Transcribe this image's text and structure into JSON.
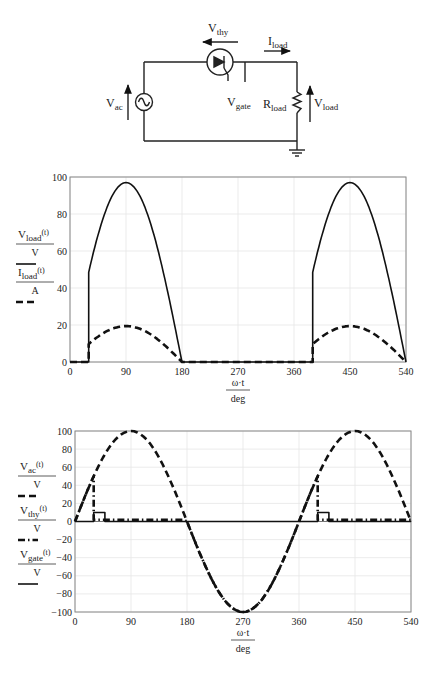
{
  "circuit": {
    "source_label": "V",
    "source_sub": "ac",
    "thyristor_label": "V",
    "thyristor_sub": "thy",
    "gate_label": "V",
    "gate_sub": "gate",
    "current_label": "I",
    "current_sub": "load",
    "resistor_label": "R",
    "resistor_sub": "load",
    "load_voltage_label": "V",
    "load_voltage_sub": "load"
  },
  "chart_data": [
    {
      "type": "line",
      "title": "",
      "xlabel": "ω·t / deg",
      "xlabel_num": "ω·t",
      "xlabel_den": "deg",
      "ylabel": "",
      "xlim": [
        0,
        540
      ],
      "ylim": [
        0,
        100
      ],
      "xticks": [
        0,
        90,
        180,
        270,
        360,
        450,
        540
      ],
      "yticks": [
        0,
        20,
        40,
        60,
        80,
        100
      ],
      "grid": true,
      "legend": [
        {
          "num": "V",
          "sub": "load",
          "arg": "(t)",
          "den": "V",
          "style": "solid"
        },
        {
          "num": "I",
          "sub": "load",
          "arg": "(t)",
          "den": "A",
          "style": "dashed"
        }
      ],
      "series": [
        {
          "name": "Vload(t)/V",
          "style": "solid",
          "x": [
            0,
            30,
            30,
            45,
            60,
            75,
            90,
            105,
            120,
            135,
            150,
            165,
            180,
            360,
            390,
            390,
            405,
            420,
            435,
            450,
            465,
            480,
            495,
            510,
            525,
            540
          ],
          "values": [
            0,
            0,
            48.5,
            68.6,
            84,
            93.7,
            97,
            93.7,
            84,
            68.6,
            48.5,
            25.1,
            0,
            0,
            0,
            48.5,
            68.6,
            84,
            93.7,
            97,
            93.7,
            84,
            68.6,
            48.5,
            25.1,
            0
          ]
        },
        {
          "name": "Iload(t)/A",
          "style": "dashed",
          "x": [
            0,
            30,
            30,
            45,
            60,
            75,
            90,
            105,
            120,
            135,
            150,
            165,
            180,
            360,
            390,
            390,
            405,
            420,
            435,
            450,
            465,
            480,
            495,
            510,
            525,
            540
          ],
          "values": [
            0,
            0,
            9.7,
            13.7,
            16.8,
            18.7,
            19.4,
            18.7,
            16.8,
            13.7,
            9.7,
            5.0,
            0,
            0,
            0,
            9.7,
            13.7,
            16.8,
            18.7,
            19.4,
            18.7,
            16.8,
            13.7,
            9.7,
            5.0,
            0
          ]
        }
      ]
    },
    {
      "type": "line",
      "title": "",
      "xlabel": "ω·t / deg",
      "xlabel_num": "ω·t",
      "xlabel_den": "deg",
      "ylabel": "",
      "xlim": [
        0,
        540
      ],
      "ylim": [
        -100,
        100
      ],
      "xticks": [
        0,
        90,
        180,
        270,
        360,
        450,
        540
      ],
      "yticks": [
        -100,
        -80,
        -60,
        -40,
        -20,
        0,
        20,
        40,
        60,
        80,
        100
      ],
      "grid": true,
      "legend": [
        {
          "num": "V",
          "sub": "ac",
          "arg": "(t)",
          "den": "V",
          "style": "dashed"
        },
        {
          "num": "V",
          "sub": "thy",
          "arg": "(t)",
          "den": "V",
          "style": "dashdot"
        },
        {
          "num": "V",
          "sub": "gate",
          "arg": "(t)",
          "den": "V",
          "style": "solid"
        }
      ],
      "series": [
        {
          "name": "Vac(t)/V",
          "style": "dashed",
          "amplitude": 100,
          "x": [
            0,
            30,
            60,
            90,
            120,
            150,
            180,
            210,
            240,
            270,
            300,
            330,
            360,
            390,
            420,
            450,
            480,
            510,
            540
          ],
          "values": [
            0,
            50,
            86.6,
            100,
            86.6,
            50,
            0,
            -50,
            -86.6,
            -100,
            -86.6,
            -50,
            0,
            50,
            86.6,
            100,
            86.6,
            50,
            0
          ]
        },
        {
          "name": "Vthy(t)/V",
          "style": "dashdot",
          "x": [
            0,
            15,
            30,
            30,
            60,
            90,
            120,
            150,
            175,
            180,
            210,
            240,
            270,
            300,
            330,
            360,
            390,
            390,
            420,
            450,
            480,
            510,
            540
          ],
          "values": [
            0,
            25.9,
            50,
            2,
            2,
            2,
            2,
            2,
            2,
            0,
            -50,
            -86.6,
            -100,
            -86.6,
            -50,
            0,
            50,
            2,
            2,
            2,
            2,
            2,
            2
          ]
        },
        {
          "name": "Vgate(t)/V",
          "style": "solid",
          "x": [
            0,
            30,
            30,
            48,
            48,
            390,
            390,
            408,
            408,
            540
          ],
          "values": [
            0,
            0,
            10,
            10,
            0,
            0,
            10,
            10,
            0,
            0
          ]
        }
      ]
    }
  ]
}
